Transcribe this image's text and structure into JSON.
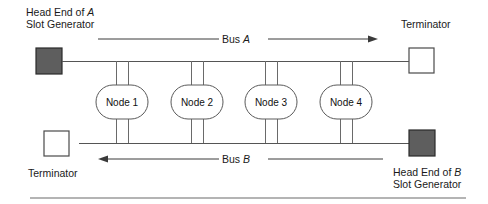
{
  "figure": {
    "labels": {
      "head_end_a_line1_pre": "Head End of ",
      "head_end_a_line1_em": "A",
      "head_end_a_line2": "Slot Generator",
      "head_end_b_line1_pre": "Head End of ",
      "head_end_b_line1_em": "B",
      "head_end_b_line2": "Slot Generator",
      "terminator_top": "Terminator",
      "terminator_bottom": "Terminator",
      "bus_a_pre": "Bus ",
      "bus_a_em": "A",
      "bus_b_pre": "Bus ",
      "bus_b_em": "B"
    },
    "nodes": [
      {
        "label": "Node 1",
        "cx": 122
      },
      {
        "label": "Node 2",
        "cx": 197
      },
      {
        "label": "Node 3",
        "cx": 271
      },
      {
        "label": "Node 4",
        "cx": 346
      }
    ],
    "bus_a": {
      "name": "Bus A",
      "direction": "right",
      "y": 61
    },
    "bus_b": {
      "name": "Bus B",
      "direction": "left",
      "y": 143
    },
    "colors": {
      "head_end_fill": "#5e5e5e",
      "terminator_fill": "#ffffff",
      "wire": "#555555",
      "text": "#1a1a1a",
      "background": "#ffffff"
    }
  }
}
